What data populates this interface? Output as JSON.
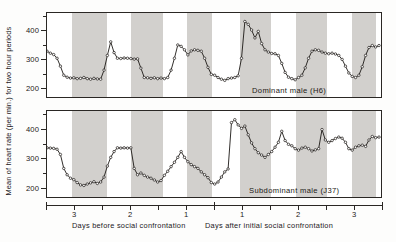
{
  "figure": {
    "ylabel": "Mean of heart rate (per min.) for two hour periods",
    "caption_left": "Days before social confrontation",
    "caption_right": "Days after initial social confrontation"
  },
  "panels": [
    {
      "id": "top",
      "caption": "Dominant male (H6)"
    },
    {
      "id": "bottom",
      "caption": "Subdominant male (J37)"
    }
  ],
  "axis": {
    "y_major": [
      "400",
      "300",
      "200"
    ],
    "y_major_values": [
      400,
      300,
      200
    ],
    "y_minor_values": [
      450,
      350,
      250
    ],
    "x_left_labels": [
      "3",
      "2",
      "1"
    ],
    "x_right_labels": [
      "1",
      "2",
      "3"
    ]
  },
  "chart_data": {
    "type": "line",
    "title": "",
    "xlabel": "Days before social confrontation | Days after initial social confrontation",
    "ylabel": "Mean of heart rate (per min.) for two hour periods",
    "ylim": [
      170,
      460
    ],
    "xlim": [
      0,
      96
    ],
    "grid": false,
    "legend": "none",
    "x_unit": "two-hour period",
    "x_tick_labels_left": [
      "3",
      "2",
      "1"
    ],
    "x_tick_labels_right": [
      "1",
      "2",
      "3"
    ],
    "confrontation_marker_x": 42,
    "night_bands": [
      {
        "panel": "both",
        "x0": 7,
        "x1": 17
      },
      {
        "panel": "both",
        "x0": 24,
        "x1": 33
      },
      {
        "panel": "both",
        "x0": 40,
        "x1": 47
      },
      {
        "panel": "both",
        "x0": 55,
        "x1": 64
      },
      {
        "panel": "both",
        "x0": 71,
        "x1": 80
      },
      {
        "panel": "both",
        "x0": 87,
        "x1": 94
      }
    ],
    "series": [
      {
        "name": "Dominant male (H6)",
        "panel": "top",
        "marker": "open-circle",
        "values": [
          325,
          318,
          313,
          300,
          272,
          240,
          233,
          230,
          231,
          228,
          229,
          232,
          228,
          226,
          229,
          227,
          226,
          258,
          310,
          358,
          320,
          300,
          299,
          301,
          300,
          299,
          297,
          298,
          265,
          232,
          231,
          229,
          231,
          228,
          230,
          228,
          232,
          258,
          300,
          347,
          342,
          330,
          312,
          326,
          330,
          328,
          325,
          300,
          268,
          243,
          240,
          232,
          226,
          222,
          228,
          230,
          232,
          238,
          300,
          430,
          420,
          400,
          372,
          395,
          352,
          330,
          322,
          317,
          316,
          310,
          282,
          250,
          233,
          228,
          224,
          232,
          240,
          266,
          300,
          325,
          330,
          328,
          322,
          318,
          316,
          318,
          315,
          310,
          296,
          272,
          248,
          236,
          232,
          240,
          270,
          310,
          338,
          345,
          340,
          345
        ]
      },
      {
        "name": "Subdominant male (J37)",
        "panel": "bottom",
        "marker": "open-circle",
        "values": [
          333,
          332,
          331,
          328,
          310,
          262,
          240,
          228,
          223,
          213,
          205,
          203,
          208,
          212,
          216,
          210,
          215,
          232,
          270,
          300,
          320,
          333,
          332,
          333,
          332,
          333,
          262,
          240,
          246,
          238,
          232,
          228,
          222,
          215,
          220,
          238,
          252,
          268,
          283,
          300,
          320,
          300,
          285,
          275,
          268,
          262,
          250,
          240,
          230,
          213,
          208,
          215,
          232,
          250,
          260,
          420,
          430,
          412,
          400,
          408,
          378,
          350,
          330,
          316,
          308,
          300,
          310,
          320,
          335,
          352,
          390,
          358,
          345,
          340,
          330,
          325,
          332,
          335,
          330,
          322,
          326,
          330,
          396,
          360,
          352,
          358,
          365,
          370,
          366,
          352,
          330,
          325,
          335,
          340,
          342,
          338,
          360,
          372,
          368,
          370
        ]
      }
    ]
  }
}
